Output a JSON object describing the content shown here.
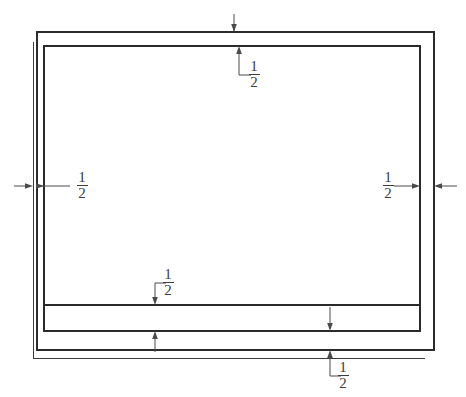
{
  "drawing": {
    "type": "engineering-dimension-drawing",
    "description": "Nested rectangular frame with 1/2 dimension callouts on all four sides",
    "background_color": "#ffffff",
    "line_color": "#2b2b2b",
    "dimension_color": "#4a4a4a",
    "geometry": {
      "outer_rect": {
        "x": 37,
        "y": 32,
        "width": 397,
        "height": 318
      },
      "inner_rect": {
        "x": 44,
        "y": 46,
        "width": 376,
        "height": 285
      },
      "offset_left_line": {
        "x": 33,
        "y1": 42,
        "y2": 358
      },
      "offset_bottom_line": {
        "y": 358,
        "x1": 33,
        "x2": 425
      },
      "band_line": {
        "y": 305,
        "x1": 44,
        "x2": 420
      }
    },
    "dimensions": [
      {
        "id": "top",
        "label": "1/2",
        "numerator": "1",
        "denominator": "2",
        "position": "top-center",
        "label_x": 247,
        "label_y": 57,
        "leader": "down-to-inner-top-edge"
      },
      {
        "id": "left",
        "label": "1/2",
        "numerator": "1",
        "denominator": "2",
        "position": "left-middle",
        "label_x": 72,
        "label_y": 178,
        "leader": "left-to-inner-left-edge"
      },
      {
        "id": "right",
        "label": "1/2",
        "numerator": "1",
        "denominator": "2",
        "position": "right-middle",
        "label_x": 378,
        "label_y": 178,
        "leader": "right-to-outer-right-edge"
      },
      {
        "id": "bottom-inner",
        "label": "1/2",
        "numerator": "1",
        "denominator": "2",
        "position": "bottom-left-of-center",
        "label_x": 155,
        "label_y": 272,
        "leader": "down-to-band-line"
      },
      {
        "id": "bottom-outer",
        "label": "1/2",
        "numerator": "1",
        "denominator": "2",
        "position": "bottom-center-right",
        "label_x": 336,
        "label_y": 359,
        "leader": "up-to-outer-bottom-edge"
      }
    ]
  }
}
